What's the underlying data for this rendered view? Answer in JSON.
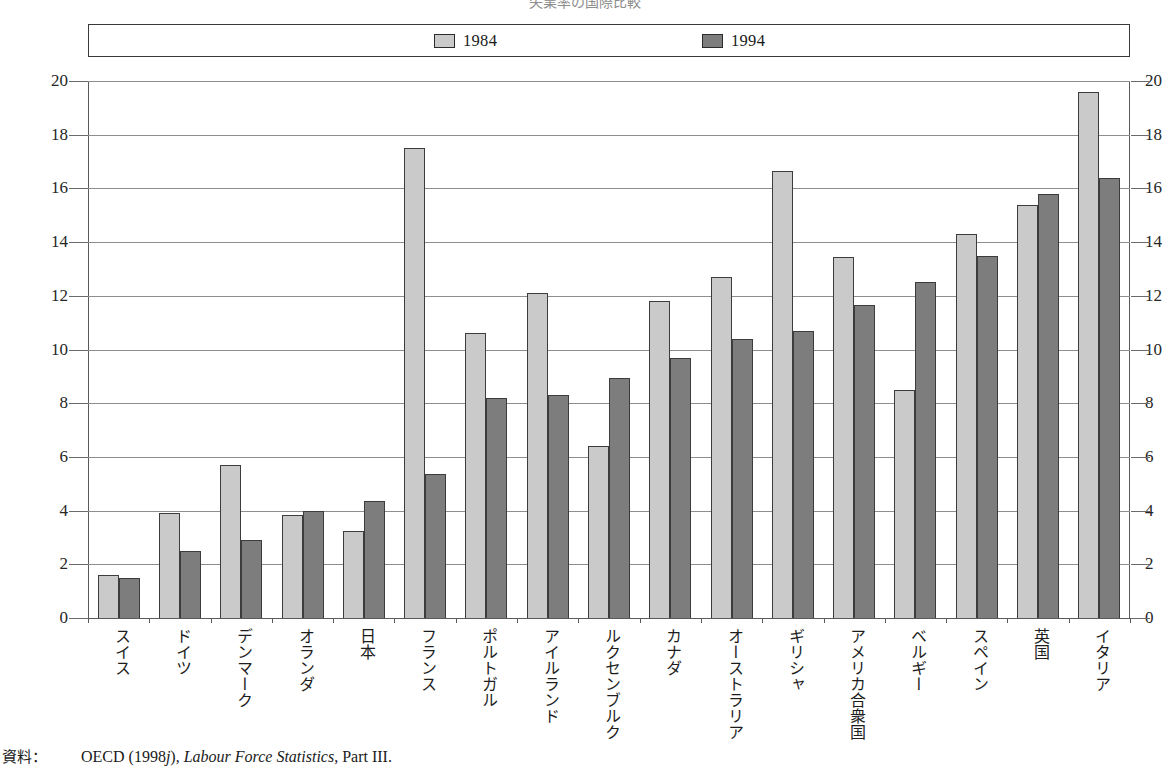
{
  "title": {
    "text": "失業率の国際比較",
    "cropped": true
  },
  "legend": {
    "position": "top-inside-box",
    "entries": [
      {
        "label": "1984",
        "color": "#cacaca",
        "icon": "legend-swatch-light"
      },
      {
        "label": "1994",
        "color": "#7d7d7d",
        "icon": "legend-swatch-dark"
      }
    ]
  },
  "source": {
    "prefix": "資料：",
    "organisation": "OECD (1998",
    "org_italic_suffix": "j",
    "org_close": "),",
    "publication": "Labour Force Statistics",
    "part": ", Part III."
  },
  "colors": {
    "series_1984": "#cacaca",
    "series_1994": "#7d7d7d",
    "bar_outline": "#3c3c3c",
    "gridline": "#8e8e8e",
    "axis": "#5a5a5a",
    "text": "#1a1a1a",
    "background": "#ffffff"
  },
  "chart_data": {
    "type": "bar",
    "title": "失業率の国際比較",
    "xlabel": "",
    "ylabel": "",
    "ylim": [
      0,
      20
    ],
    "yticks": [
      0,
      2,
      4,
      6,
      8,
      10,
      12,
      14,
      16,
      18,
      20
    ],
    "grid": true,
    "dual_axis": true,
    "legend_position": "top",
    "unit": "%",
    "categories": [
      "スイス",
      "ドイツ",
      "デンマーク",
      "オランダ",
      "日本",
      "フランス",
      "ポルトガル",
      "アイルランド",
      "ルクセンブルク",
      "カナダ",
      "オーストラリア",
      "ギリシャ",
      "アメリカ合衆国",
      "ベルギー",
      "スペイン",
      "英国",
      "イタリア"
    ],
    "series": [
      {
        "name": "1984",
        "color": "#cacaca",
        "values": [
          1.6,
          3.9,
          5.7,
          3.85,
          3.25,
          17.5,
          10.6,
          12.1,
          6.4,
          11.8,
          12.7,
          16.65,
          13.45,
          8.5,
          14.3,
          15.4,
          19.6
        ]
      },
      {
        "name": "1994",
        "color": "#7d7d7d",
        "values": [
          1.5,
          2.5,
          2.9,
          4.0,
          4.35,
          5.35,
          8.2,
          8.3,
          8.95,
          9.7,
          10.4,
          10.7,
          11.65,
          12.5,
          13.5,
          15.8,
          16.4
        ]
      }
    ]
  }
}
